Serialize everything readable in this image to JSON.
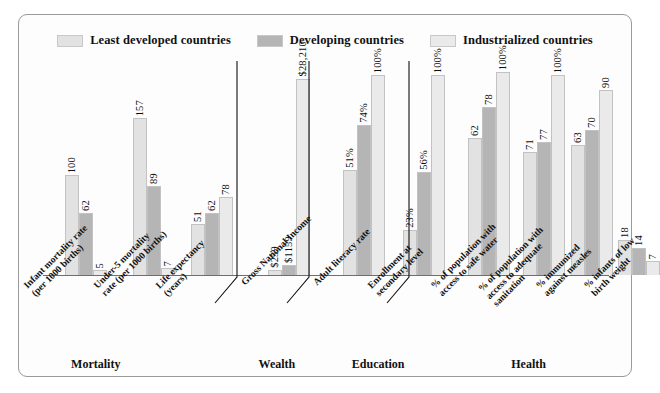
{
  "legend": {
    "items": [
      {
        "label": "Least developed countries",
        "color": "#e2e2e2"
      },
      {
        "label": "Developing countries",
        "color": "#b5b5b5"
      },
      {
        "label": "Industrialized countries",
        "color": "#eaeaea"
      }
    ]
  },
  "sections": [
    {
      "name": "Mortality",
      "center_pct": 12.5
    },
    {
      "name": "Wealth",
      "center_pct": 42.0
    },
    {
      "name": "Education",
      "center_pct": 58.5
    },
    {
      "name": "Health",
      "center_pct": 83.0
    }
  ],
  "chart_data": {
    "type": "bar",
    "title": "",
    "xlabel": "",
    "ylabel": "",
    "grid": false,
    "legend_position": "top",
    "categories": [
      "Infant mortality rate (per 1000 births)",
      "Under-5 mortality rate (per 1000 births)",
      "Life expectancy (years)",
      "Gross National Income",
      "Adult literacy rate",
      "Enrollment at secondary level",
      "% of population with access to safe water",
      "% of population with access to adequate sanitation",
      "% immunized against measles",
      "% infants of low birth weight"
    ],
    "category_lines": [
      [
        "Infant mortality rate",
        "(per 1000 births)"
      ],
      [
        "Under-5 mortality",
        "rate (per 1000 births)"
      ],
      [
        "Life expectancy",
        "(years)"
      ],
      [
        "Gross National Income"
      ],
      [
        "Adult literacy rate"
      ],
      [
        "Enrollment at",
        "secondary level"
      ],
      [
        "% of population with",
        "access to safe water"
      ],
      [
        "% of population with",
        "access to adequate",
        "sanitation"
      ],
      [
        "% immunized",
        "against measles"
      ],
      [
        "% infants of low",
        "birth weight"
      ]
    ],
    "series": [
      {
        "name": "Least developed countries",
        "color": "#e2e2e2",
        "values": [
          100,
          157,
          51,
          259,
          51,
          23,
          62,
          71,
          63,
          18
        ],
        "labels": [
          "100",
          "157",
          "51",
          "$259",
          "51%",
          "23%",
          "62",
          "71",
          "63",
          "18"
        ]
      },
      {
        "name": "Developing countries",
        "color": "#b5b5b5",
        "values": [
          62,
          89,
          62,
          1159,
          74,
          56,
          78,
          77,
          70,
          14
        ],
        "labels": [
          "62",
          "89",
          "62",
          "$1159",
          "74%",
          "56%",
          "78",
          "77",
          "70",
          "14"
        ]
      },
      {
        "name": "Industrialized countries",
        "color": "#eaeaea",
        "values": [
          5,
          7,
          78,
          28210,
          100,
          100,
          100,
          100,
          90,
          7
        ],
        "labels": [
          "5",
          "7",
          "78",
          "$28,210",
          "100%",
          "100%",
          "100%",
          "100%",
          "90",
          "7"
        ]
      }
    ],
    "group_section": [
      0,
      0,
      0,
      1,
      2,
      2,
      3,
      3,
      3,
      3
    ],
    "bar_pixel_heights": [
      [
        100,
        157,
        51,
        5,
        105,
        45,
        137,
        123,
        130,
        35
      ],
      [
        62,
        89,
        62,
        10,
        150,
        103,
        168,
        133,
        145,
        27
      ],
      [
        5,
        7,
        78,
        196,
        200,
        200,
        203,
        200,
        185,
        14
      ]
    ]
  }
}
